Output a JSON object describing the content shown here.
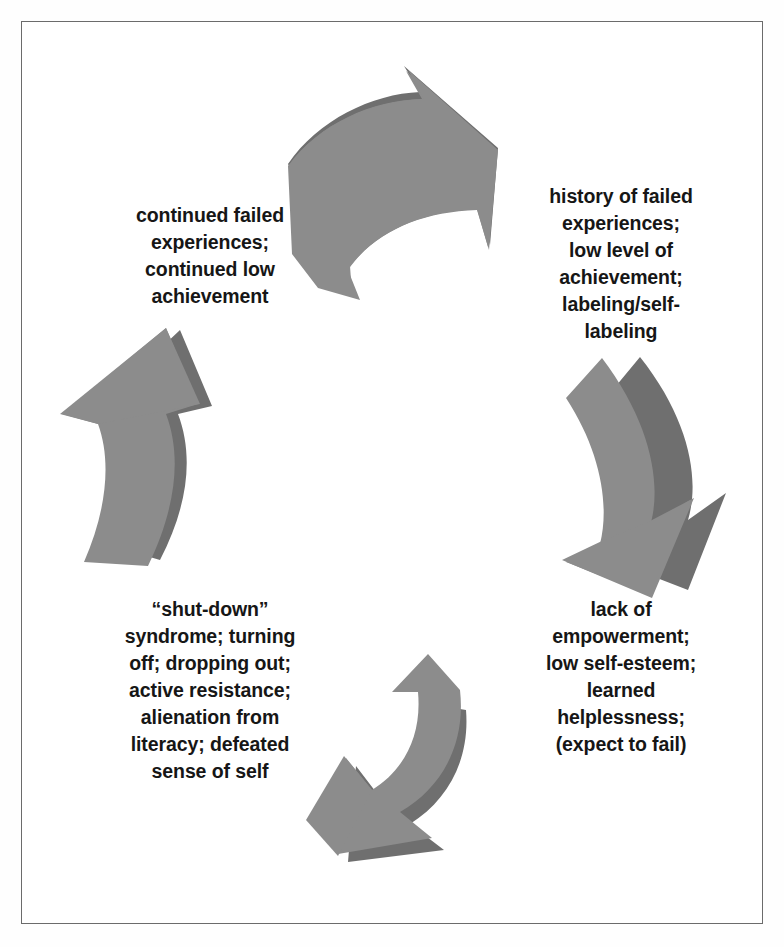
{
  "diagram": {
    "type": "cycle",
    "title": "",
    "border_color": "#6b6b6b",
    "background_color": "#ffffff",
    "arrow_face_color": "#8c8c8c",
    "arrow_side_color": "#6f6f6f",
    "arrow_count": 4,
    "stages": [
      {
        "id": "stage-1",
        "position": "top-right",
        "text": "history of failed\nexperiences;\nlow level of\nachievement;\nlabeling/self-\nlabeling"
      },
      {
        "id": "stage-2",
        "position": "bottom-right",
        "text": "lack of\nempowerment;\nlow self-esteem;\nlearned\nhelplessness;\n(expect to fail)"
      },
      {
        "id": "stage-3",
        "position": "bottom-left",
        "text": "“shut-down”\nsyndrome; turning\noff; dropping out;\nactive resistance;\nalienation from\nliteracy; defeated\nsense of self"
      },
      {
        "id": "stage-4",
        "position": "top-left",
        "text": "continued failed\nexperiences;\ncontinued low\nachievement"
      }
    ],
    "arrows": [
      {
        "id": "arrow-top",
        "direction": "clockwise-top-to-right",
        "from": "stage-4",
        "to": "stage-1"
      },
      {
        "id": "arrow-right",
        "direction": "clockwise-right-to-bottom",
        "from": "stage-1",
        "to": "stage-2"
      },
      {
        "id": "arrow-bottom",
        "direction": "clockwise-bottom-to-left",
        "from": "stage-2",
        "to": "stage-3"
      },
      {
        "id": "arrow-left",
        "direction": "clockwise-left-to-top",
        "from": "stage-3",
        "to": "stage-4"
      }
    ]
  }
}
